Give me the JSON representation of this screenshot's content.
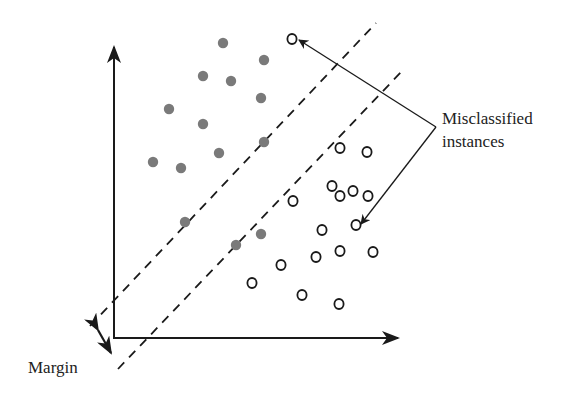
{
  "diagram": {
    "type": "svm-soft-margin",
    "colors": {
      "filled": "#7a7a7a",
      "open_stroke": "#1a1a1a",
      "axis": "#1a1a1a",
      "dash": "#1a1a1a"
    },
    "labels": {
      "misclassified_line1": "Misclassified",
      "misclassified_line2": "instances",
      "margin": "Margin"
    },
    "filled_points": [
      [
        223,
        43
      ],
      [
        264,
        60
      ],
      [
        203,
        76
      ],
      [
        231,
        81
      ],
      [
        261,
        98
      ],
      [
        169,
        109
      ],
      [
        203,
        124
      ],
      [
        264,
        142
      ],
      [
        219,
        153
      ],
      [
        153,
        162
      ],
      [
        181,
        168
      ],
      [
        185,
        222
      ],
      [
        236,
        245
      ],
      [
        261,
        234
      ]
    ],
    "open_points": [
      [
        292,
        39
      ],
      [
        340,
        148
      ],
      [
        367,
        152
      ],
      [
        332,
        186
      ],
      [
        340,
        196
      ],
      [
        353,
        191
      ],
      [
        368,
        196
      ],
      [
        293,
        201
      ],
      [
        356,
        225
      ],
      [
        322,
        230
      ],
      [
        340,
        251
      ],
      [
        373,
        252
      ],
      [
        316,
        257
      ],
      [
        281,
        265
      ],
      [
        252,
        283
      ],
      [
        302,
        295
      ],
      [
        339,
        304
      ]
    ],
    "misclassified_points": [
      [
        292,
        39
      ],
      [
        356,
        225
      ]
    ]
  }
}
